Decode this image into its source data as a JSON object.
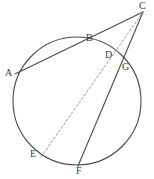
{
  "figure": {
    "background_color": "#ffffff",
    "stroke_color": "#4a4a4a",
    "dashed_stroke_color": "#9a9a9a",
    "label_color": "#3a3a3a",
    "width": 154,
    "height": 179
  },
  "circle": {
    "name": "main-circle",
    "cx": 77,
    "cy": 101,
    "r": 64
  },
  "points": {
    "A": {
      "label": "A",
      "x": 15,
      "y": 74,
      "label_x": 5,
      "label_y": 68
    },
    "B": {
      "label": "B",
      "x": 92,
      "y": 45,
      "label_x": 86,
      "label_y": 33
    },
    "C": {
      "label": "C",
      "x": 143,
      "y": 12,
      "label_x": 139,
      "label_y": 1
    },
    "D": {
      "label": "D",
      "x": 113,
      "y": 62,
      "label_x": 105,
      "label_y": 50
    },
    "E": {
      "label": "E",
      "x": 41,
      "y": 157,
      "label_x": 30,
      "label_y": 149
    },
    "F": {
      "label": "F",
      "x": 78,
      "y": 166,
      "label_x": 76,
      "label_y": 166
    },
    "G": {
      "label": "G",
      "x": 124,
      "y": 70,
      "label_x": 122,
      "label_y": 62
    }
  },
  "segments": [
    {
      "name": "secant-A-to-C",
      "from": "A",
      "to": "C",
      "style": "solid",
      "through": "B"
    },
    {
      "name": "secant-F-to-C",
      "from": "F",
      "to": "C",
      "style": "solid",
      "through": "G"
    },
    {
      "name": "dashed-chord-E-to-C",
      "from": "E",
      "to": "C",
      "style": "dashed",
      "through": "D"
    }
  ],
  "chart_data": {
    "type": "diagram",
    "shapes": [
      {
        "kind": "circle",
        "center": [
          77,
          101
        ],
        "radius": 64
      },
      {
        "kind": "line",
        "points": [
          [
            15,
            74
          ],
          [
            143,
            12
          ]
        ],
        "dashed": false
      },
      {
        "kind": "line",
        "points": [
          [
            78,
            166
          ],
          [
            143,
            12
          ]
        ],
        "dashed": false
      },
      {
        "kind": "line",
        "points": [
          [
            41,
            157
          ],
          [
            143,
            12
          ]
        ],
        "dashed": true
      }
    ],
    "labels": [
      "A",
      "B",
      "C",
      "D",
      "E",
      "F",
      "G"
    ]
  }
}
